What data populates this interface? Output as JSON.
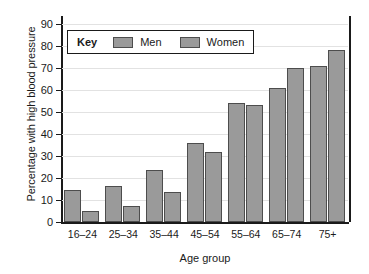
{
  "chart_data": {
    "type": "bar",
    "title": "",
    "xlabel": "Age group",
    "ylabel": "Percentage with high blood pressure",
    "categories": [
      "16–24",
      "25–34",
      "35–44",
      "45–54",
      "55–64",
      "65–74",
      "75+"
    ],
    "series": [
      {
        "name": "Men",
        "values": [
          14.5,
          16.5,
          23.5,
          36,
          54,
          61,
          71
        ]
      },
      {
        "name": "Women",
        "values": [
          5,
          7.5,
          13.5,
          32,
          53,
          70,
          78
        ]
      }
    ],
    "ylim": [
      0,
      90
    ],
    "ytick_values": [
      0,
      10,
      20,
      30,
      40,
      50,
      60,
      70,
      80,
      90
    ],
    "ytick_labels": [
      "0",
      "10",
      "20",
      "30",
      "40",
      "50",
      "60",
      "70",
      "80",
      "90"
    ],
    "grid": true,
    "legend_position": "upper left",
    "bar_color": "#9a9a9a",
    "bar_edge_color": "#4d4d4d"
  },
  "legend": {
    "key_label": "Key",
    "entries": [
      {
        "label": "Men"
      },
      {
        "label": "Women"
      }
    ]
  }
}
